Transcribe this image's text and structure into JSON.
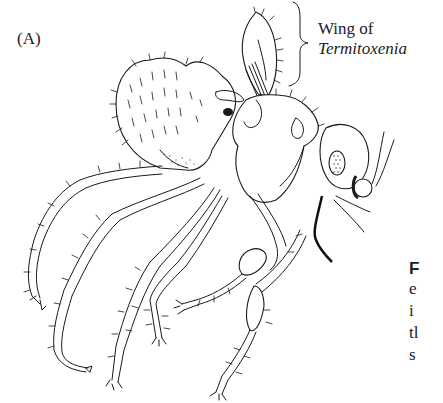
{
  "figure": {
    "panel_label": "(A)",
    "callout": {
      "line1": "Wing of",
      "line2": "Termitoxenia"
    },
    "caption_fragment": {
      "lead": "F",
      "lines": [
        "e",
        "i",
        "tl",
        "s"
      ]
    },
    "illustration": "termitoxenia-insect-line-drawing"
  }
}
